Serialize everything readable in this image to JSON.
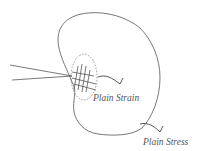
{
  "diagram": {
    "labels": {
      "plain_strain": "Plain Strain",
      "plain_stress": "Plain Stress"
    },
    "elements": [
      "body-outline",
      "crack",
      "plastic-zone",
      "hatched-region",
      "plain-strain-arrow",
      "plain-stress-arrow"
    ],
    "colors": {
      "line": "#555555",
      "background": "#ffffff"
    }
  }
}
